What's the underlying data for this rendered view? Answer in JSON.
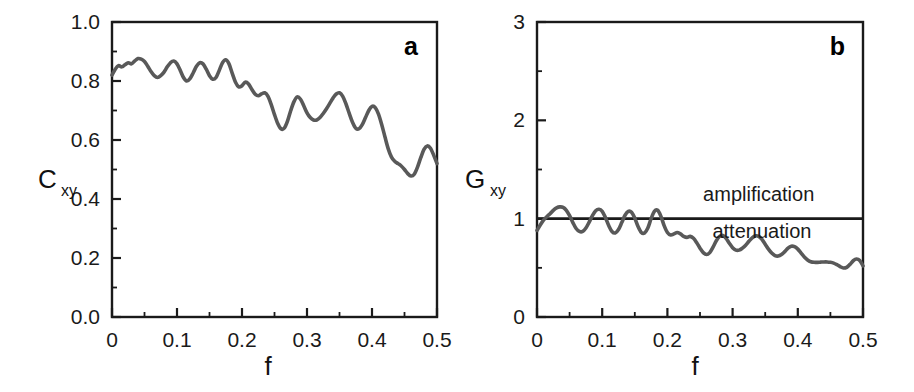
{
  "figure": {
    "background_color": "#ffffff",
    "curve_color": "#595959",
    "axis_color": "#1a1a1a",
    "width": 914,
    "height": 392
  },
  "panels": [
    {
      "letter": "a",
      "ylabel_main": "C",
      "ylabel_sub": "xy",
      "xlabel": "f"
    },
    {
      "letter": "b",
      "ylabel_main": "G",
      "ylabel_sub": "xy",
      "xlabel": "f"
    }
  ],
  "chart_data": [
    {
      "type": "line",
      "panel": "a",
      "title": "",
      "xlabel": "f",
      "ylabel": "C_xy",
      "xlim": [
        0.0,
        0.5
      ],
      "ylim": [
        0.0,
        1.0
      ],
      "xticks": [
        0,
        0.1,
        0.2,
        0.3,
        0.4,
        0.5
      ],
      "xticklabels": [
        "0",
        "0.1",
        "0.2",
        "0.3",
        "0.4",
        "0.5"
      ],
      "yticks": [
        0.0,
        0.2,
        0.4,
        0.6,
        0.8,
        1.0
      ],
      "yticklabels": [
        "0.0",
        "0.2",
        "0.4",
        "0.6",
        "0.8",
        "1.0"
      ],
      "xminor_ticks": [
        0.05,
        0.15,
        0.25,
        0.35,
        0.45
      ],
      "yminor_ticks": [
        0.1,
        0.3,
        0.5,
        0.7,
        0.9
      ],
      "grid": false,
      "legend": null,
      "annotations": [],
      "series": [
        {
          "name": "coherence",
          "x": [
            0.0,
            0.005,
            0.01,
            0.015,
            0.02,
            0.025,
            0.03,
            0.035,
            0.04,
            0.045,
            0.05,
            0.055,
            0.06,
            0.065,
            0.07,
            0.075,
            0.08,
            0.085,
            0.09,
            0.095,
            0.1,
            0.105,
            0.11,
            0.115,
            0.12,
            0.125,
            0.13,
            0.135,
            0.14,
            0.145,
            0.15,
            0.155,
            0.16,
            0.165,
            0.17,
            0.175,
            0.18,
            0.185,
            0.19,
            0.195,
            0.2,
            0.205,
            0.21,
            0.215,
            0.22,
            0.225,
            0.23,
            0.235,
            0.24,
            0.245,
            0.25,
            0.255,
            0.26,
            0.265,
            0.27,
            0.275,
            0.28,
            0.285,
            0.29,
            0.295,
            0.3,
            0.305,
            0.31,
            0.315,
            0.32,
            0.325,
            0.33,
            0.335,
            0.34,
            0.345,
            0.35,
            0.355,
            0.36,
            0.365,
            0.37,
            0.375,
            0.38,
            0.385,
            0.39,
            0.395,
            0.4,
            0.405,
            0.41,
            0.415,
            0.42,
            0.425,
            0.43,
            0.435,
            0.44,
            0.445,
            0.45,
            0.455,
            0.46,
            0.465,
            0.47,
            0.475,
            0.48,
            0.485,
            0.49,
            0.495,
            0.5
          ],
          "y": [
            0.82,
            0.84,
            0.852,
            0.848,
            0.855,
            0.862,
            0.858,
            0.868,
            0.876,
            0.874,
            0.866,
            0.85,
            0.832,
            0.818,
            0.812,
            0.818,
            0.83,
            0.848,
            0.862,
            0.868,
            0.858,
            0.836,
            0.812,
            0.8,
            0.808,
            0.828,
            0.85,
            0.862,
            0.858,
            0.84,
            0.818,
            0.806,
            0.812,
            0.836,
            0.862,
            0.872,
            0.858,
            0.826,
            0.796,
            0.78,
            0.784,
            0.796,
            0.79,
            0.772,
            0.756,
            0.75,
            0.756,
            0.76,
            0.748,
            0.72,
            0.686,
            0.656,
            0.638,
            0.64,
            0.664,
            0.7,
            0.73,
            0.746,
            0.738,
            0.716,
            0.692,
            0.676,
            0.668,
            0.668,
            0.676,
            0.69,
            0.706,
            0.724,
            0.742,
            0.756,
            0.76,
            0.748,
            0.722,
            0.69,
            0.66,
            0.64,
            0.638,
            0.652,
            0.676,
            0.7,
            0.714,
            0.71,
            0.688,
            0.652,
            0.61,
            0.57,
            0.542,
            0.528,
            0.52,
            0.512,
            0.5,
            0.486,
            0.478,
            0.484,
            0.508,
            0.54,
            0.568,
            0.58,
            0.572,
            0.548,
            0.52
          ]
        }
      ]
    },
    {
      "type": "line",
      "panel": "b",
      "title": "",
      "xlabel": "f",
      "ylabel": "G_xy",
      "xlim": [
        0.0,
        0.5
      ],
      "ylim": [
        0.0,
        3.0
      ],
      "xticks": [
        0,
        0.1,
        0.2,
        0.3,
        0.4,
        0.5
      ],
      "xticklabels": [
        "0",
        "0.1",
        "0.2",
        "0.3",
        "0.4",
        "0.5"
      ],
      "yticks": [
        0,
        1,
        2,
        3
      ],
      "yticklabels": [
        "0",
        "1",
        "2",
        "3"
      ],
      "xminor_ticks": [
        0.05,
        0.15,
        0.25,
        0.35,
        0.45
      ],
      "yminor_ticks": [
        0.5,
        1.5,
        2.5
      ],
      "grid": false,
      "legend": null,
      "reference_line": {
        "y": 1.0,
        "label_above": "amplification",
        "label_below": "attenuation"
      },
      "annotations": [
        {
          "text": "amplification",
          "x": 0.34,
          "y": 1.18
        },
        {
          "text": "attenuation",
          "x": 0.345,
          "y": 0.8
        }
      ],
      "series": [
        {
          "name": "gain",
          "x": [
            0.0,
            0.005,
            0.01,
            0.015,
            0.02,
            0.025,
            0.03,
            0.035,
            0.04,
            0.045,
            0.05,
            0.055,
            0.06,
            0.065,
            0.07,
            0.075,
            0.08,
            0.085,
            0.09,
            0.095,
            0.1,
            0.105,
            0.11,
            0.115,
            0.12,
            0.125,
            0.13,
            0.135,
            0.14,
            0.145,
            0.15,
            0.155,
            0.16,
            0.165,
            0.17,
            0.175,
            0.18,
            0.185,
            0.19,
            0.195,
            0.2,
            0.205,
            0.21,
            0.215,
            0.22,
            0.225,
            0.23,
            0.235,
            0.24,
            0.245,
            0.25,
            0.255,
            0.26,
            0.265,
            0.27,
            0.275,
            0.28,
            0.285,
            0.29,
            0.295,
            0.3,
            0.305,
            0.31,
            0.315,
            0.32,
            0.325,
            0.33,
            0.335,
            0.34,
            0.345,
            0.35,
            0.355,
            0.36,
            0.365,
            0.37,
            0.375,
            0.38,
            0.385,
            0.39,
            0.395,
            0.4,
            0.405,
            0.41,
            0.415,
            0.42,
            0.425,
            0.43,
            0.435,
            0.44,
            0.445,
            0.45,
            0.455,
            0.46,
            0.465,
            0.47,
            0.475,
            0.48,
            0.485,
            0.49,
            0.495,
            0.5
          ],
          "y": [
            0.88,
            0.935,
            0.985,
            1.02,
            1.05,
            1.085,
            1.11,
            1.12,
            1.115,
            1.085,
            1.03,
            0.96,
            0.9,
            0.87,
            0.87,
            0.905,
            0.965,
            1.03,
            1.08,
            1.095,
            1.075,
            1.01,
            0.93,
            0.87,
            0.855,
            0.89,
            0.96,
            1.035,
            1.075,
            1.065,
            1.005,
            0.92,
            0.86,
            0.855,
            0.905,
            1.0,
            1.075,
            1.085,
            1.025,
            0.93,
            0.86,
            0.835,
            0.845,
            0.86,
            0.845,
            0.82,
            0.81,
            0.82,
            0.8,
            0.755,
            0.7,
            0.655,
            0.635,
            0.655,
            0.71,
            0.775,
            0.82,
            0.83,
            0.8,
            0.75,
            0.705,
            0.68,
            0.68,
            0.7,
            0.73,
            0.77,
            0.805,
            0.825,
            0.82,
            0.79,
            0.74,
            0.69,
            0.65,
            0.625,
            0.62,
            0.635,
            0.665,
            0.7,
            0.72,
            0.715,
            0.69,
            0.65,
            0.61,
            0.58,
            0.562,
            0.556,
            0.556,
            0.558,
            0.56,
            0.56,
            0.556,
            0.548,
            0.532,
            0.512,
            0.498,
            0.505,
            0.535,
            0.572,
            0.59,
            0.575,
            0.52
          ]
        }
      ]
    }
  ]
}
